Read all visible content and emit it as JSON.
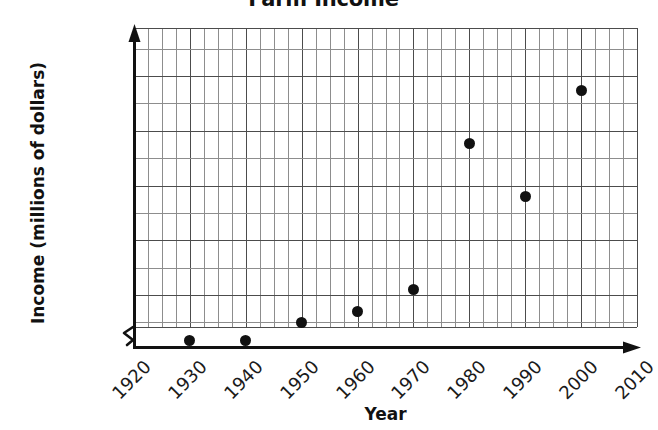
{
  "chart_data": {
    "type": "scatter",
    "title": "Farm Income",
    "xlabel": "Year",
    "ylabel": "Income (millions of dollars)",
    "x": [
      1930,
      1940,
      1950,
      1960,
      1970,
      1980,
      1990,
      2000
    ],
    "values": [
      5000,
      6000,
      25000,
      35000,
      55000,
      188000,
      140000,
      237000
    ],
    "points": [
      {
        "year": 1930,
        "income": 5000
      },
      {
        "year": 1940,
        "income": 6000
      },
      {
        "year": 1950,
        "income": 25000
      },
      {
        "year": 1960,
        "income": 35000
      },
      {
        "year": 1970,
        "income": 55000
      },
      {
        "year": 1980,
        "income": 188000
      },
      {
        "year": 1990,
        "income": 140000
      },
      {
        "year": 2000,
        "income": 237000
      }
    ],
    "xlim": [
      1920,
      2010
    ],
    "ylim": [
      0,
      275000
    ],
    "x_tick_labels": [
      "1920",
      "1930",
      "1940",
      "1950",
      "1960",
      "1970",
      "1980",
      "1990",
      "2000",
      "2010"
    ],
    "x_ticks": [
      1920,
      1930,
      1940,
      1950,
      1960,
      1970,
      1980,
      1990,
      2000,
      2010
    ],
    "y_tick_labels": [
      "0",
      "50,000",
      "100,000",
      "150,000",
      "200,000",
      "250,000"
    ],
    "y_ticks": [
      0,
      50000,
      100000,
      150000,
      200000,
      250000
    ],
    "grid": true,
    "grid_minor_y_step": 25000,
    "grid_minor_x_per_decade": 3,
    "y_axis_break": true,
    "legend": null,
    "marker_color": "#111111",
    "grid_color": "#4c4c4c",
    "minor_grid_color": "#8d8d8d",
    "axis_color": "#111111"
  }
}
